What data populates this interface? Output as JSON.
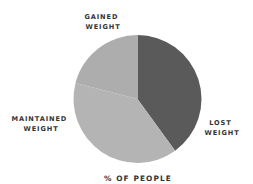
{
  "chart_data": {
    "type": "pie",
    "title": "",
    "xlabel": "% OF PEOPLE",
    "ylabel": "",
    "legend": "none",
    "slices": [
      {
        "label_lines": [
          "LOST",
          "WEIGHT"
        ],
        "value": 40,
        "color": "#5a5a5a"
      },
      {
        "label_lines": [
          "MAINTAINED",
          "WEIGHT"
        ],
        "value": 39,
        "color": "#b4b4b4"
      },
      {
        "label_lines": [
          "GAINED",
          "WEIGHT"
        ],
        "value": 21,
        "color": "#adadad"
      }
    ],
    "start_angle": "top",
    "direction": "clockwise"
  }
}
